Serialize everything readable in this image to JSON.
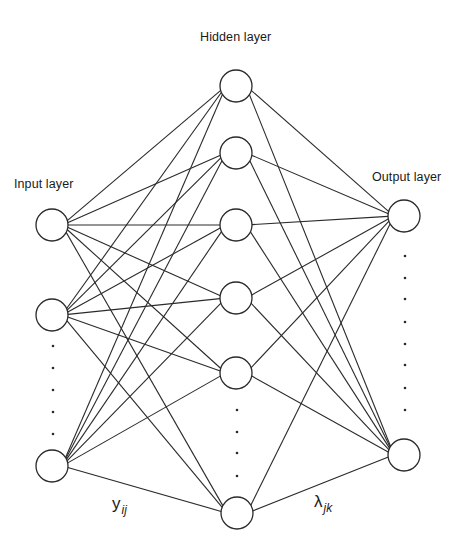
{
  "diagram": {
    "stroke_color": "#2a2a2a",
    "background": "#ffffff",
    "node_radius": 16,
    "labels": {
      "hidden": {
        "text": "Hidden layer",
        "x": 200,
        "y": 30
      },
      "input": {
        "text": "Input layer",
        "x": 14,
        "y": 177
      },
      "output": {
        "text": "Output layer",
        "x": 372,
        "y": 170
      }
    },
    "weight_labels": {
      "input_hidden": {
        "base": "y",
        "sub": "ij",
        "x": 112,
        "y": 494
      },
      "hidden_output": {
        "base": "λ",
        "sub": "jk",
        "x": 314,
        "y": 492
      }
    },
    "layers": {
      "input": {
        "name": "input",
        "nodes": [
          {
            "id": "i1",
            "cx": 52,
            "cy": 225
          },
          {
            "id": "i2",
            "cx": 52,
            "cy": 315
          },
          {
            "id": "i3",
            "cx": 52,
            "cy": 466
          }
        ],
        "ellipsis_dots": [
          {
            "cx": 53,
            "cy": 346
          },
          {
            "cx": 53,
            "cy": 368
          },
          {
            "cx": 53,
            "cy": 390
          },
          {
            "cx": 53,
            "cy": 412
          },
          {
            "cx": 53,
            "cy": 434
          }
        ]
      },
      "hidden": {
        "name": "hidden",
        "nodes": [
          {
            "id": "h1",
            "cx": 236,
            "cy": 86
          },
          {
            "id": "h2",
            "cx": 236,
            "cy": 153
          },
          {
            "id": "h3",
            "cx": 236,
            "cy": 225
          },
          {
            "id": "h4",
            "cx": 236,
            "cy": 298
          },
          {
            "id": "h5",
            "cx": 236,
            "cy": 373
          },
          {
            "id": "h6",
            "cx": 237,
            "cy": 513
          }
        ],
        "ellipsis_dots": [
          {
            "cx": 237,
            "cy": 410
          },
          {
            "cx": 237,
            "cy": 432
          },
          {
            "cx": 237,
            "cy": 453
          },
          {
            "cx": 237,
            "cy": 476
          }
        ]
      },
      "output": {
        "name": "output",
        "nodes": [
          {
            "id": "o1",
            "cx": 404,
            "cy": 216
          },
          {
            "id": "o2",
            "cx": 404,
            "cy": 455
          }
        ],
        "ellipsis_dots": [
          {
            "cx": 405,
            "cy": 256
          },
          {
            "cx": 405,
            "cy": 278
          },
          {
            "cx": 405,
            "cy": 299
          },
          {
            "cx": 405,
            "cy": 322
          },
          {
            "cx": 405,
            "cy": 344
          },
          {
            "cx": 405,
            "cy": 365
          },
          {
            "cx": 405,
            "cy": 388
          },
          {
            "cx": 405,
            "cy": 410
          }
        ]
      }
    },
    "connections": [
      {
        "from": "input",
        "to": "hidden",
        "type": "fully-connected"
      },
      {
        "from": "hidden",
        "to": "output",
        "type": "fully-connected"
      }
    ]
  }
}
